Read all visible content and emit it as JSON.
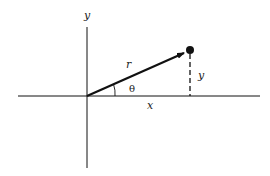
{
  "diagram": {
    "labels": {
      "y_axis": "y",
      "radius": "r",
      "angle": "θ",
      "x_component": "x",
      "y_component": "y"
    },
    "colors": {
      "line": "#111111",
      "background": "#ffffff"
    },
    "geometry": {
      "origin": [
        87,
        96
      ],
      "point": [
        190,
        50
      ],
      "x_axis_range": [
        18,
        260
      ],
      "y_axis_range": [
        27,
        168
      ]
    }
  }
}
